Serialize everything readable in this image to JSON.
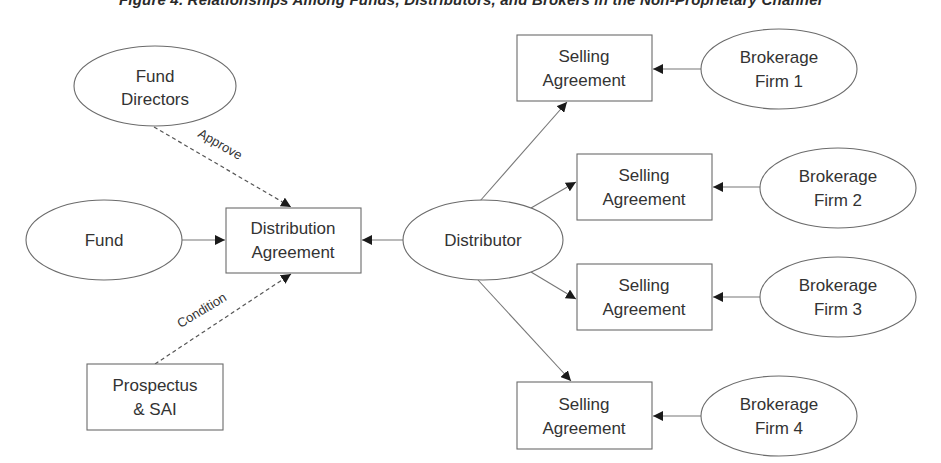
{
  "title": "Figure 4. Relationships Among Funds, Distributors, and Brokers in the Non-Proprietary Channel",
  "colors": {
    "stroke": "#6b6b6b",
    "text": "#333333",
    "arrowhead": "#1a1a1a",
    "background": "#ffffff"
  },
  "nodes": {
    "fund_directors": {
      "shape": "ellipse",
      "line1": "Fund",
      "line2": "Directors"
    },
    "fund": {
      "shape": "ellipse",
      "line1": "Fund"
    },
    "distribution_agreement": {
      "shape": "box",
      "line1": "Distribution",
      "line2": "Agreement"
    },
    "prospectus_sai": {
      "shape": "box",
      "line1": "Prospectus",
      "line2": "& SAI"
    },
    "distributor": {
      "shape": "ellipse",
      "line1": "Distributor"
    },
    "selling_agreements": [
      {
        "line1": "Selling",
        "line2": "Agreement"
      },
      {
        "line1": "Selling",
        "line2": "Agreement"
      },
      {
        "line1": "Selling",
        "line2": "Agreement"
      },
      {
        "line1": "Selling",
        "line2": "Agreement"
      }
    ],
    "brokerage_firms": [
      {
        "line1": "Brokerage",
        "line2": "Firm 1"
      },
      {
        "line1": "Brokerage",
        "line2": "Firm 2"
      },
      {
        "line1": "Brokerage",
        "line2": "Firm 3"
      },
      {
        "line1": "Brokerage",
        "line2": "Firm 4"
      }
    ]
  },
  "edges": {
    "approve_label": "Approve",
    "condition_label": "Condition",
    "list": [
      {
        "from": "Fund Directors",
        "to": "Distribution Agreement",
        "style": "dashed",
        "label": "Approve"
      },
      {
        "from": "Prospectus & SAI",
        "to": "Distribution Agreement",
        "style": "dashed",
        "label": "Condition"
      },
      {
        "from": "Fund",
        "to": "Distribution Agreement",
        "style": "solid"
      },
      {
        "from": "Distributor",
        "to": "Distribution Agreement",
        "style": "solid"
      },
      {
        "from": "Distributor",
        "to": "Selling Agreement 1",
        "style": "solid"
      },
      {
        "from": "Distributor",
        "to": "Selling Agreement 2",
        "style": "solid"
      },
      {
        "from": "Distributor",
        "to": "Selling Agreement 3",
        "style": "solid"
      },
      {
        "from": "Distributor",
        "to": "Selling Agreement 4",
        "style": "solid"
      },
      {
        "from": "Brokerage Firm 1",
        "to": "Selling Agreement 1",
        "style": "solid"
      },
      {
        "from": "Brokerage Firm 2",
        "to": "Selling Agreement 2",
        "style": "solid"
      },
      {
        "from": "Brokerage Firm 3",
        "to": "Selling Agreement 3",
        "style": "solid"
      },
      {
        "from": "Brokerage Firm 4",
        "to": "Selling Agreement 4",
        "style": "solid"
      }
    ]
  }
}
